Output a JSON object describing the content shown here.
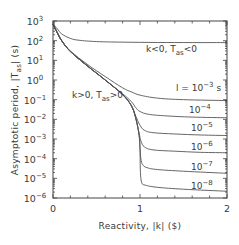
{
  "chart_data": {
    "type": "line",
    "title": "",
    "xlabel": "Reactivity, |k| ($)",
    "ylabel": "Asymptotic period, |T_as| (s)",
    "xlim": [
      0,
      2
    ],
    "ylim": [
      1e-06,
      1000.0
    ],
    "yscale": "log",
    "grid": false,
    "legend": "inline annotations",
    "x_ticks": [
      "0",
      "1",
      "2"
    ],
    "y_ticks": [
      "10^3",
      "10^2",
      "10^1",
      "10^0",
      "10^-1",
      "10^-2",
      "10^-3",
      "10^-4",
      "10^-5",
      "10^-6"
    ],
    "annotations": [
      {
        "text": "k<0,  T_as<0",
        "x": 1.35,
        "y": 30
      },
      {
        "text": "k>0,  T_as>0",
        "x": 0.3,
        "y": 0.1
      },
      {
        "text": "l = 10^-3 s",
        "x": 1.6,
        "y": 0.5
      },
      {
        "text": "10^-4",
        "x": 1.65,
        "y": 0.018
      },
      {
        "text": "10^-5",
        "x": 1.65,
        "y": 0.0015
      },
      {
        "text": "10^-6",
        "x": 1.65,
        "y": 0.00015
      },
      {
        "text": "10^-7",
        "x": 1.65,
        "y": 1.5e-05
      },
      {
        "text": "10^-8",
        "x": 1.65,
        "y": 1.3e-06
      }
    ],
    "series": [
      {
        "name": "k<0, T_as<0",
        "x": [
          0.0,
          0.05,
          0.1,
          0.2,
          0.3,
          0.5,
          0.8,
          1.2,
          1.6,
          2.0
        ],
        "y": [
          700,
          400,
          220,
          130,
          105,
          90,
          84,
          81,
          80,
          80
        ]
      },
      {
        "name": "l=1e-3 s",
        "x": [
          0.0,
          0.05,
          0.1,
          0.2,
          0.4,
          0.6,
          0.8,
          0.9,
          1.0,
          1.2,
          1.5,
          2.0
        ],
        "y": [
          700,
          250,
          100,
          30,
          6,
          1.5,
          0.4,
          0.25,
          0.17,
          0.12,
          0.1,
          0.09
        ]
      },
      {
        "name": "l=1e-4 s",
        "x": [
          0.0,
          0.05,
          0.1,
          0.2,
          0.4,
          0.6,
          0.8,
          0.9,
          0.95,
          1.0,
          1.1,
          1.3,
          1.6,
          2.0
        ],
        "y": [
          700,
          250,
          100,
          28,
          5,
          1.0,
          0.2,
          0.08,
          0.04,
          0.025,
          0.018,
          0.015,
          0.013,
          0.012
        ]
      },
      {
        "name": "l=1e-5 s",
        "x": [
          0.0,
          0.05,
          0.1,
          0.2,
          0.4,
          0.6,
          0.8,
          0.9,
          0.95,
          1.0,
          1.05,
          1.15,
          1.4,
          1.7,
          2.0
        ],
        "y": [
          700,
          250,
          100,
          28,
          5,
          1.0,
          0.18,
          0.05,
          0.015,
          0.005,
          0.0028,
          0.0021,
          0.0018,
          0.0016,
          0.0015
        ]
      },
      {
        "name": "l=1e-6 s",
        "x": [
          0.0,
          0.05,
          0.1,
          0.2,
          0.4,
          0.6,
          0.8,
          0.9,
          0.95,
          0.99,
          1.01,
          1.05,
          1.15,
          1.4,
          1.7,
          2.0
        ],
        "y": [
          700,
          250,
          100,
          28,
          5,
          1.0,
          0.18,
          0.05,
          0.012,
          0.002,
          0.0008,
          0.0004,
          0.00028,
          0.00024,
          0.00021,
          0.0002
        ]
      },
      {
        "name": "l=1e-7 s",
        "x": [
          0.0,
          0.05,
          0.1,
          0.2,
          0.4,
          0.6,
          0.8,
          0.9,
          0.95,
          0.99,
          1.0,
          1.01,
          1.03,
          1.08,
          1.2,
          1.5,
          2.0
        ],
        "y": [
          700,
          250,
          100,
          28,
          5,
          1.0,
          0.18,
          0.05,
          0.012,
          0.0015,
          0.0004,
          0.0001,
          5e-05,
          3.5e-05,
          2.8e-05,
          2.3e-05,
          1.8e-05
        ]
      },
      {
        "name": "l=1e-8 s",
        "x": [
          0.0,
          0.05,
          0.1,
          0.2,
          0.4,
          0.6,
          0.8,
          0.9,
          0.95,
          0.99,
          1.0,
          1.005,
          1.02,
          1.06,
          1.2,
          1.5,
          2.0
        ],
        "y": [
          700,
          250,
          100,
          28,
          5,
          1.0,
          0.18,
          0.05,
          0.012,
          0.0015,
          0.0002,
          2e-05,
          6e-06,
          4.5e-06,
          3.5e-06,
          2.8e-06,
          2.2e-06
        ]
      }
    ]
  },
  "labels": {
    "xlabel": "Reactivity,  |k|  ($)",
    "ylabel_main": "Asymptotic period,  |T",
    "ylabel_sub": "as",
    "ylabel_tail": "|  (s)",
    "neg_prefix": "k<0,  T",
    "neg_sub": "as",
    "neg_suffix": "<0",
    "pos_prefix": "k>0,  T",
    "pos_sub": "as",
    "pos_suffix": ">0",
    "l_prefix": "l = 10",
    "l_exp": "−3",
    "l_unit": " s",
    "curve_labels": [
      {
        "base": "10",
        "exp": "−4"
      },
      {
        "base": "10",
        "exp": "−5"
      },
      {
        "base": "10",
        "exp": "−6"
      },
      {
        "base": "10",
        "exp": "−7"
      },
      {
        "base": "10",
        "exp": "−8"
      }
    ],
    "yticks": [
      {
        "base": "10",
        "exp": "3"
      },
      {
        "base": "10",
        "exp": "2"
      },
      {
        "base": "10",
        "exp": "1"
      },
      {
        "base": "10",
        "exp": "0"
      },
      {
        "base": "10",
        "exp": "−1"
      },
      {
        "base": "10",
        "exp": "−2"
      },
      {
        "base": "10",
        "exp": "−3"
      },
      {
        "base": "10",
        "exp": "−4"
      },
      {
        "base": "10",
        "exp": "−5"
      },
      {
        "base": "10",
        "exp": "−6"
      }
    ],
    "xticks": [
      "0",
      "1",
      "2"
    ]
  },
  "style": {
    "line_color": "#555555",
    "frame_color": "#444444"
  }
}
